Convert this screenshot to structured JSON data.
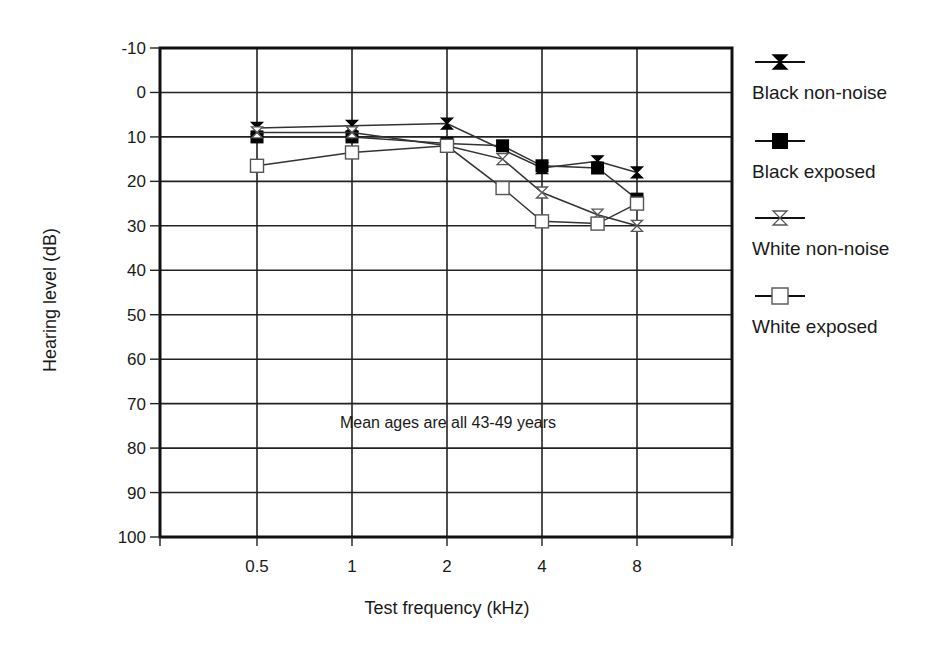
{
  "chart_data": {
    "type": "line",
    "title": "",
    "xlabel": "Test frequency (kHz)",
    "ylabel": "Hearing level (dB)",
    "annotation": "Mean ages are all 43-49 years",
    "x_tick_labels": [
      "0.5",
      "1",
      "2",
      "4",
      "8"
    ],
    "y_tick_labels": [
      "-10",
      "0",
      "10",
      "20",
      "30",
      "40",
      "50",
      "60",
      "70",
      "80",
      "90",
      "100"
    ],
    "ylim": [
      -10,
      100
    ],
    "y_inverted": true,
    "grid": true,
    "legend_position": "right",
    "series": [
      {
        "name": "Black non-noise",
        "marker": "filled-hourglass",
        "x": [
          0.5,
          1,
          2,
          4,
          6,
          8
        ],
        "values": [
          8,
          7.5,
          7,
          17,
          15.5,
          18
        ]
      },
      {
        "name": "Black exposed",
        "marker": "filled-square",
        "x": [
          0.5,
          1,
          2,
          3,
          4,
          6,
          8
        ],
        "values": [
          10,
          10,
          11.5,
          12,
          16.5,
          17,
          24
        ]
      },
      {
        "name": "White non-noise",
        "marker": "open-hourglass",
        "x": [
          0.5,
          1,
          2,
          3,
          4,
          6,
          8
        ],
        "values": [
          9,
          9,
          12,
          15,
          22.5,
          27.5,
          30
        ]
      },
      {
        "name": "White exposed",
        "marker": "open-square",
        "x": [
          0.5,
          1,
          2,
          3,
          4,
          6,
          8
        ],
        "values": [
          16.5,
          13.5,
          12,
          21.5,
          29,
          29.5,
          25
        ]
      }
    ]
  },
  "legend": {
    "items": [
      {
        "label": "Black non-noise"
      },
      {
        "label": "Black exposed"
      },
      {
        "label": "White non-noise"
      },
      {
        "label": "White exposed"
      }
    ]
  },
  "colors": {
    "line": "#333333",
    "frame": "#111111",
    "background": "#ffffff"
  }
}
